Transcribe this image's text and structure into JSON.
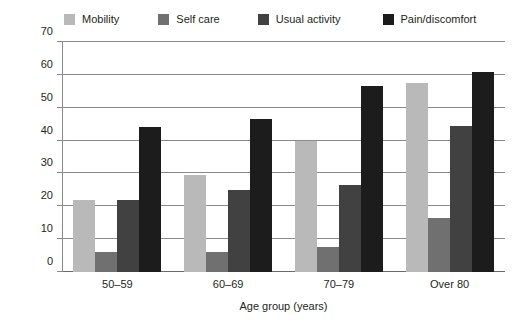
{
  "chart_data": {
    "type": "bar",
    "title": "",
    "subtitle": "",
    "xlabel": "Age group (years)",
    "ylabel": "Percentage reporting problem",
    "categories": [
      "50–59",
      "60–69",
      "70–79",
      "Over 80"
    ],
    "series": [
      {
        "name": "Mobility",
        "color": "#b9b9b9",
        "values": [
          22,
          29.5,
          40,
          57.5
        ]
      },
      {
        "name": "Self care",
        "color": "#707070",
        "values": [
          6,
          6,
          7.5,
          16.5
        ]
      },
      {
        "name": "Usual activity",
        "color": "#414141",
        "values": [
          22,
          25,
          26.5,
          44.5
        ]
      },
      {
        "name": "Pain/discomfort",
        "color": "#1c1c1c",
        "values": [
          44,
          46.5,
          56.5,
          61
        ]
      }
    ],
    "ylim": [
      0,
      70
    ],
    "yticks": [
      0,
      10,
      20,
      30,
      40,
      50,
      60,
      70
    ],
    "ytick_labels": [
      "0",
      "10",
      "20",
      "30",
      "40",
      "50",
      "60",
      "70"
    ],
    "grid": true,
    "legend_position": "top",
    "axis_color": "#8a8a8a",
    "background": "#ffffff"
  }
}
